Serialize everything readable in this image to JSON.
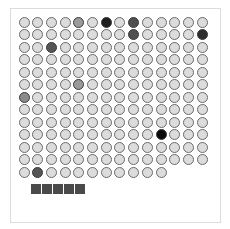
{
  "board": {
    "rows": 13,
    "cols": 14,
    "last_row_cols": 11,
    "origin_x": 24,
    "origin_y": 22,
    "pitch_x": 13.7,
    "pitch_y": 12.5,
    "default_fill": "#dcdcdc",
    "default_border": "#6a6a6a",
    "marked_cells": [
      {
        "row": 0,
        "col": 4,
        "fill": "#9a9a9a"
      },
      {
        "row": 0,
        "col": 6,
        "fill": "#1e1e1e"
      },
      {
        "row": 0,
        "col": 8,
        "fill": "#505050"
      },
      {
        "row": 1,
        "col": 8,
        "fill": "#505050"
      },
      {
        "row": 1,
        "col": 13,
        "fill": "#2e2e2e"
      },
      {
        "row": 2,
        "col": 2,
        "fill": "#555555"
      },
      {
        "row": 5,
        "col": 4,
        "fill": "#999999"
      },
      {
        "row": 6,
        "col": 0,
        "fill": "#8a8a8a"
      },
      {
        "row": 9,
        "col": 10,
        "fill": "#0a0a0a"
      },
      {
        "row": 12,
        "col": 1,
        "fill": "#555555"
      }
    ]
  },
  "tray": {
    "piece_count": 5,
    "piece_color": "#4a4a4a"
  }
}
